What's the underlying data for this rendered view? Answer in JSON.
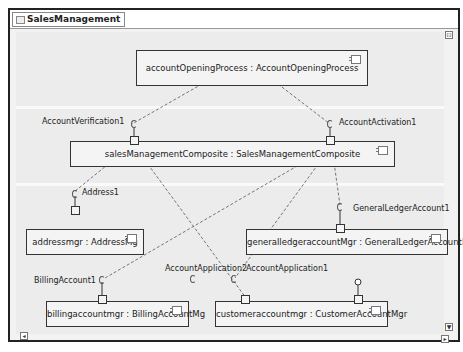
{
  "diagram": {
    "title": "SalesManagement",
    "components": [
      {
        "id": "aop",
        "label": "accountOpeningProcess : AccountOpeningProcess"
      },
      {
        "id": "smc",
        "label": "salesManagementComposite : SalesManagementComposite"
      },
      {
        "id": "addr",
        "label": "addressmgr : AddressMg"
      },
      {
        "id": "gla",
        "label": "generalledgeraccountMgr : GeneralLedgerAccountMgr"
      },
      {
        "id": "bill",
        "label": "billingaccountmgr : BillingAccountMg"
      },
      {
        "id": "cust",
        "label": "customeraccountmgr : CustomerAccountMgr"
      }
    ],
    "ports": [
      {
        "label": "AccountVerification1"
      },
      {
        "label": "AccountActivation1"
      },
      {
        "label": "Address1"
      },
      {
        "label": "GeneralLedgerAccount1"
      },
      {
        "label": "BillingAccount1"
      },
      {
        "label": "AccountApplication2"
      },
      {
        "label": "AccountApplication1"
      }
    ],
    "controls": {
      "collapse": "⊡",
      "scroll_down": "▼",
      "scroll_right": "▸",
      "scroll_left": "◂"
    }
  }
}
